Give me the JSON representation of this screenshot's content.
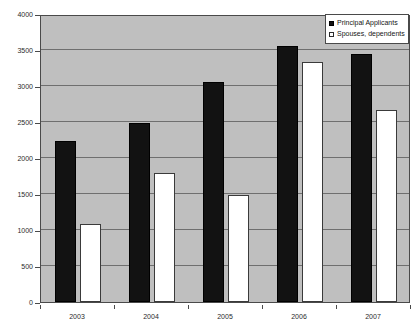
{
  "chart_data": {
    "type": "bar",
    "title": "",
    "xlabel": "",
    "ylabel": "",
    "categories": [
      "2003",
      "2004",
      "2005",
      "2006",
      "2007"
    ],
    "series": [
      {
        "name": "Principal Applicants",
        "color": "#121212",
        "values": [
          2230,
          2490,
          3060,
          3550,
          3440
        ]
      },
      {
        "name": "Spouses, dependents",
        "color": "#ffffff",
        "values": [
          1080,
          1790,
          1490,
          3330,
          2660
        ]
      }
    ],
    "ylim": [
      0,
      4000
    ],
    "y_ticks": [
      0,
      500,
      1000,
      1500,
      2000,
      2500,
      3000,
      3500,
      4000
    ],
    "y_tick_labels": [
      "0",
      "500",
      "1000",
      "1500",
      "2000",
      "2500",
      "3000",
      "3500",
      "4000"
    ],
    "grid": true,
    "legend_position": "top-right",
    "plot_background": "#bfbfbf",
    "axis_color": "#4a4a4a",
    "gridline_color": "#6f6f6f"
  }
}
